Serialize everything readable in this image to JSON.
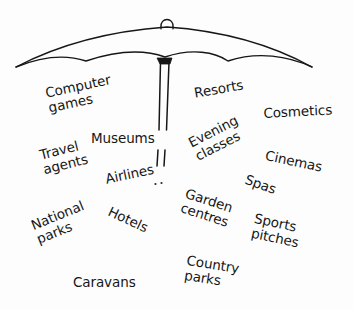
{
  "diagram": {
    "type": "concept-illustration",
    "background_color": "#fdfdfd",
    "ink_color": "#161616",
    "umbrella": {
      "name": "umbrella",
      "canopy_description": "hand-drawn open umbrella canopy with scalloped lower edge",
      "finial_description": "small loop at apex of canopy",
      "pole_description": "two thin parallel vertical lines forming the shaft, fading into dots lower down",
      "stroke_color": "#161616"
    },
    "labels": [
      {
        "id": "computer-games",
        "text": "Computer\ngames",
        "lines": [
          "Computer",
          "games"
        ],
        "x": 44,
        "y": 86,
        "rotation": -12,
        "font_size": 13.5
      },
      {
        "id": "resorts",
        "text": "Resorts",
        "lines": [
          "Resorts"
        ],
        "x": 193,
        "y": 86,
        "rotation": -10,
        "font_size": 13.5
      },
      {
        "id": "cosmetics",
        "text": "Cosmetics",
        "lines": [
          "Cosmetics"
        ],
        "x": 263,
        "y": 106,
        "rotation": -3,
        "font_size": 13.5
      },
      {
        "id": "museums",
        "text": "Museums",
        "lines": [
          "Museums"
        ],
        "x": 91,
        "y": 131,
        "rotation": 0,
        "font_size": 13.5
      },
      {
        "id": "evening-classes",
        "text": "Evening\nclasses",
        "lines": [
          "Evening",
          "classes"
        ],
        "x": 186,
        "y": 137,
        "rotation": -27,
        "font_size": 13.5
      },
      {
        "id": "cinemas",
        "text": "Cinemas",
        "lines": [
          "Cinemas"
        ],
        "x": 267,
        "y": 148,
        "rotation": 12,
        "font_size": 13.5
      },
      {
        "id": "travel-agents",
        "text": "Travel\nagents",
        "lines": [
          "Travel",
          "agents"
        ],
        "x": 38,
        "y": 148,
        "rotation": -14,
        "font_size": 13.5
      },
      {
        "id": "airlines",
        "text": "Airlines",
        "lines": [
          "Airlines"
        ],
        "x": 104,
        "y": 172,
        "rotation": -12,
        "font_size": 13.5
      },
      {
        "id": "spas",
        "text": "Spas",
        "lines": [
          "Spas"
        ],
        "x": 248,
        "y": 172,
        "rotation": 20,
        "font_size": 13.5
      },
      {
        "id": "garden-centres",
        "text": "Garden\ncentres",
        "lines": [
          "Garden",
          "centres"
        ],
        "x": 188,
        "y": 186,
        "rotation": 18,
        "font_size": 13.5
      },
      {
        "id": "hotels",
        "text": "Hotels",
        "lines": [
          "Hotels"
        ],
        "x": 112,
        "y": 204,
        "rotation": 25,
        "font_size": 13.5
      },
      {
        "id": "sports-pitches",
        "text": "Sports\npitches",
        "lines": [
          "Sports",
          "pitches"
        ],
        "x": 256,
        "y": 211,
        "rotation": 12,
        "font_size": 13.5
      },
      {
        "id": "national-parks",
        "text": "National\nparks",
        "lines": [
          "National",
          "parks"
        ],
        "x": 29,
        "y": 219,
        "rotation": -22,
        "font_size": 13.5
      },
      {
        "id": "country-parks",
        "text": "Country\nparks",
        "lines": [
          "Country",
          "parks"
        ],
        "x": 188,
        "y": 253,
        "rotation": 9,
        "font_size": 13.5
      },
      {
        "id": "caravans",
        "text": "Caravans",
        "lines": [
          "Caravans"
        ],
        "x": 73,
        "y": 275,
        "rotation": 0,
        "font_size": 13.5
      }
    ]
  }
}
